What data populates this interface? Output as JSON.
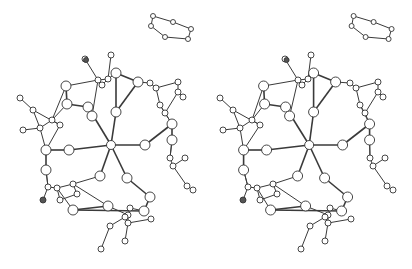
{
  "figure": {
    "type": "stereo-pair ball-and-stick molecular structure",
    "panels": [
      "left-view",
      "right-view"
    ],
    "stereo_offset_x": 200,
    "colors": {
      "bond": "#3a3a3a",
      "atom_fill": "#ffffff",
      "atom_stroke": "#333333",
      "background": "#ffffff"
    },
    "atoms": [
      {
        "id": "c",
        "x": 111,
        "y": 145,
        "r": 4.5
      },
      {
        "id": "s1",
        "x": 88,
        "y": 107,
        "r": 5
      },
      {
        "id": "s2",
        "x": 116,
        "y": 112,
        "r": 5
      },
      {
        "id": "s3",
        "x": 145,
        "y": 145,
        "r": 5
      },
      {
        "id": "s4",
        "x": 127,
        "y": 178,
        "r": 5
      },
      {
        "id": "s5",
        "x": 100,
        "y": 176,
        "r": 5
      },
      {
        "id": "s6",
        "x": 69,
        "y": 150,
        "r": 5
      },
      {
        "id": "b1",
        "x": 66,
        "y": 86,
        "r": 5
      },
      {
        "id": "b2",
        "x": 67,
        "y": 104,
        "r": 5
      },
      {
        "id": "b3",
        "x": 92,
        "y": 116,
        "r": 5
      },
      {
        "id": "b4",
        "x": 138,
        "y": 82,
        "r": 5
      },
      {
        "id": "b5",
        "x": 116,
        "y": 73,
        "r": 5
      },
      {
        "id": "b6",
        "x": 172,
        "y": 124,
        "r": 5
      },
      {
        "id": "b7",
        "x": 46,
        "y": 150,
        "r": 5
      },
      {
        "id": "b8",
        "x": 46,
        "y": 170,
        "r": 5
      },
      {
        "id": "b9",
        "x": 108,
        "y": 206,
        "r": 5
      },
      {
        "id": "b10",
        "x": 144,
        "y": 211,
        "r": 5
      },
      {
        "id": "b11",
        "x": 73,
        "y": 210,
        "r": 5
      },
      {
        "id": "b12",
        "x": 150,
        "y": 197,
        "r": 5
      },
      {
        "id": "b13",
        "x": 172,
        "y": 140,
        "r": 5
      },
      {
        "id": "h1",
        "x": 85,
        "y": 59,
        "r": 3
      },
      {
        "id": "h2",
        "x": 111,
        "y": 55,
        "r": 3
      },
      {
        "id": "h3",
        "x": 98,
        "y": 80,
        "r": 3
      },
      {
        "id": "h4",
        "x": 108,
        "y": 79,
        "r": 3
      },
      {
        "id": "h5",
        "x": 102,
        "y": 85,
        "r": 3
      },
      {
        "id": "h6",
        "x": 20,
        "y": 98,
        "r": 3
      },
      {
        "id": "h7",
        "x": 33,
        "y": 110,
        "r": 3
      },
      {
        "id": "h8",
        "x": 23,
        "y": 130,
        "r": 3
      },
      {
        "id": "h9",
        "x": 40,
        "y": 128,
        "r": 3
      },
      {
        "id": "h10",
        "x": 52,
        "y": 120,
        "r": 3
      },
      {
        "id": "h11",
        "x": 60,
        "y": 125,
        "r": 3
      },
      {
        "id": "h12",
        "x": 150,
        "y": 83,
        "r": 3
      },
      {
        "id": "h13",
        "x": 156,
        "y": 88,
        "r": 3
      },
      {
        "id": "h14",
        "x": 178,
        "y": 82,
        "r": 3
      },
      {
        "id": "h15",
        "x": 178,
        "y": 92,
        "r": 3
      },
      {
        "id": "h16",
        "x": 183,
        "y": 97,
        "r": 3
      },
      {
        "id": "h17",
        "x": 160,
        "y": 105,
        "r": 3
      },
      {
        "id": "h18",
        "x": 165,
        "y": 113,
        "r": 3
      },
      {
        "id": "h19",
        "x": 48,
        "y": 187,
        "r": 3
      },
      {
        "id": "h20",
        "x": 57,
        "y": 188,
        "r": 3
      },
      {
        "id": "h21",
        "x": 43,
        "y": 200,
        "r": 3,
        "dark": true
      },
      {
        "id": "h22",
        "x": 73,
        "y": 184,
        "r": 3
      },
      {
        "id": "h23",
        "x": 77,
        "y": 194,
        "r": 3
      },
      {
        "id": "h24",
        "x": 60,
        "y": 200,
        "r": 3
      },
      {
        "id": "h25",
        "x": 170,
        "y": 158,
        "r": 3
      },
      {
        "id": "h26",
        "x": 173,
        "y": 166,
        "r": 3
      },
      {
        "id": "h27",
        "x": 185,
        "y": 158,
        "r": 3
      },
      {
        "id": "h28",
        "x": 187,
        "y": 186,
        "r": 3
      },
      {
        "id": "h29",
        "x": 193,
        "y": 190,
        "r": 3
      },
      {
        "id": "h30",
        "x": 130,
        "y": 208,
        "r": 3
      },
      {
        "id": "h31",
        "x": 128,
        "y": 215,
        "r": 3
      },
      {
        "id": "h32",
        "x": 125,
        "y": 217,
        "r": 3
      },
      {
        "id": "h33",
        "x": 110,
        "y": 226,
        "r": 3
      },
      {
        "id": "h34",
        "x": 128,
        "y": 223,
        "r": 3
      },
      {
        "id": "h35",
        "x": 125,
        "y": 241,
        "r": 3
      },
      {
        "id": "h36",
        "x": 101,
        "y": 249,
        "r": 3
      },
      {
        "id": "h37",
        "x": 151,
        "y": 219,
        "r": 3
      },
      {
        "id": "h38",
        "x": 86,
        "y": 60,
        "r": 2.5,
        "dark": true
      },
      {
        "id": "r1",
        "x": 153,
        "y": 16,
        "r": 2.5
      },
      {
        "id": "r2",
        "x": 173,
        "y": 22,
        "r": 2.5
      },
      {
        "id": "r3",
        "x": 191,
        "y": 29,
        "r": 2.5
      },
      {
        "id": "r4",
        "x": 188,
        "y": 39,
        "r": 2.5
      },
      {
        "id": "r5",
        "x": 165,
        "y": 37,
        "r": 2.5
      },
      {
        "id": "r6",
        "x": 151,
        "y": 26,
        "r": 2.5
      }
    ],
    "bonds": [
      [
        "c",
        "s1"
      ],
      [
        "c",
        "s2"
      ],
      [
        "c",
        "s3"
      ],
      [
        "c",
        "s4"
      ],
      [
        "c",
        "s5"
      ],
      [
        "c",
        "s6"
      ],
      [
        "s1",
        "b2"
      ],
      [
        "s1",
        "b3"
      ],
      [
        "b3",
        "h3"
      ],
      [
        "b2",
        "b1"
      ],
      [
        "b1",
        "h3"
      ],
      [
        "b2",
        "h10"
      ],
      [
        "s2",
        "b5"
      ],
      [
        "b5",
        "h4"
      ],
      [
        "b5",
        "b4"
      ],
      [
        "b4",
        "h12"
      ],
      [
        "s2",
        "b4"
      ],
      [
        "s3",
        "b6"
      ],
      [
        "b6",
        "h17"
      ],
      [
        "b6",
        "b13"
      ],
      [
        "b13",
        "h25"
      ],
      [
        "s6",
        "b7"
      ],
      [
        "b7",
        "b8"
      ],
      [
        "b8",
        "h19"
      ],
      [
        "b7",
        "h9"
      ],
      [
        "s5",
        "h22"
      ],
      [
        "h22",
        "b9"
      ],
      [
        "b9",
        "b11"
      ],
      [
        "b11",
        "h20"
      ],
      [
        "s4",
        "b12"
      ],
      [
        "b12",
        "b10"
      ],
      [
        "b10",
        "h30"
      ],
      [
        "b9",
        "h31"
      ],
      [
        "h1",
        "h3"
      ],
      [
        "h2",
        "h4"
      ],
      [
        "h3",
        "h4"
      ],
      [
        "h4",
        "h5"
      ],
      [
        "h3",
        "h5"
      ],
      [
        "h6",
        "h7"
      ],
      [
        "h7",
        "h9"
      ],
      [
        "h8",
        "h9"
      ],
      [
        "h9",
        "h10"
      ],
      [
        "h10",
        "h11"
      ],
      [
        "h7",
        "h11"
      ],
      [
        "h12",
        "h13"
      ],
      [
        "h13",
        "h14"
      ],
      [
        "h14",
        "h15"
      ],
      [
        "h15",
        "h16"
      ],
      [
        "h13",
        "h17"
      ],
      [
        "h17",
        "h18"
      ],
      [
        "h18",
        "h15"
      ],
      [
        "h19",
        "h20"
      ],
      [
        "h19",
        "h21"
      ],
      [
        "h20",
        "h22"
      ],
      [
        "h22",
        "h23"
      ],
      [
        "h23",
        "h24"
      ],
      [
        "h20",
        "h24"
      ],
      [
        "h25",
        "h26"
      ],
      [
        "h26",
        "h27"
      ],
      [
        "h26",
        "h28"
      ],
      [
        "h28",
        "h29"
      ],
      [
        "h25",
        "b13"
      ],
      [
        "h30",
        "h31"
      ],
      [
        "h31",
        "h32"
      ],
      [
        "h32",
        "h33"
      ],
      [
        "h33",
        "h36"
      ],
      [
        "h31",
        "h34"
      ],
      [
        "h34",
        "h35"
      ],
      [
        "h34",
        "h37"
      ],
      [
        "b8",
        "h19"
      ],
      [
        "b11",
        "b10"
      ],
      [
        "b7",
        "h11"
      ],
      [
        "b1",
        "h10"
      ],
      [
        "b6",
        "h18"
      ],
      [
        "r1",
        "r2"
      ],
      [
        "r2",
        "r3"
      ],
      [
        "r3",
        "r4"
      ],
      [
        "r4",
        "r5"
      ],
      [
        "r5",
        "r6"
      ],
      [
        "r6",
        "r1"
      ]
    ]
  }
}
